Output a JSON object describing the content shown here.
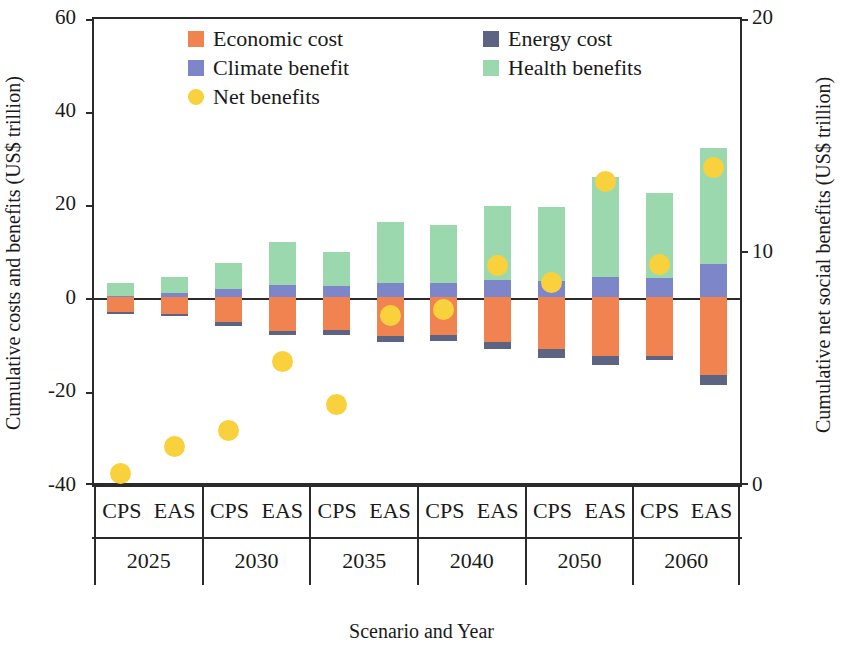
{
  "chart_data": {
    "type": "bar",
    "title": "",
    "xlabel": "Scenario and Year",
    "ylabel": "Cumulative costs and benefits (US$ trillion)",
    "ylabel_right": "Cumulative  net social benefits (US$ trillion)",
    "ylim": [
      -40,
      60
    ],
    "yticks": [
      "60",
      "40",
      "20",
      "0",
      "-20",
      "-40"
    ],
    "ylim_right": [
      0,
      20
    ],
    "yticks_right": [
      "20",
      "10",
      "0"
    ],
    "grid": false,
    "legend_position": "top-center",
    "stacked": true,
    "years": [
      "2025",
      "2030",
      "2035",
      "2040",
      "2050",
      "2060"
    ],
    "scenarios": [
      "CPS",
      "EAS"
    ],
    "categories": [
      "2025 CPS",
      "2025 EAS",
      "2030 CPS",
      "2030 EAS",
      "2035 CPS",
      "2035 EAS",
      "2040 CPS",
      "2040 EAS",
      "2050 CPS",
      "2050 EAS",
      "2060 CPS",
      "2060 EAS"
    ],
    "series": [
      {
        "name": "Economic cost",
        "color": "#F0834F",
        "values": [
          -3.2,
          -3.6,
          -5.4,
          -7.2,
          -7.0,
          -8.4,
          -8.0,
          -9.6,
          -11.2,
          -12.6,
          -12.6,
          -16.8
        ]
      },
      {
        "name": "Energy cost",
        "color": "#5D6383",
        "values": [
          -0.4,
          -0.5,
          -0.8,
          -1.0,
          -1.0,
          -1.2,
          -1.4,
          -1.6,
          -1.8,
          -2.0,
          -1.0,
          -2.0
        ]
      },
      {
        "name": "Climate benefit",
        "color": "#7D86C9",
        "values": [
          0.4,
          0.9,
          1.8,
          2.6,
          2.4,
          3.2,
          3.0,
          3.8,
          3.6,
          4.4,
          4.2,
          7.2
        ]
      },
      {
        "name": "Health benefits",
        "color": "#9CD8AE",
        "values": [
          2.6,
          3.5,
          5.6,
          9.4,
          7.4,
          13.0,
          12.6,
          15.8,
          15.8,
          21.6,
          18.4,
          25.0
        ]
      }
    ],
    "net_benefits": {
      "name": "Net benefits",
      "color": "#F9D13C",
      "axis": "right",
      "unit": "US$ trillion",
      "values_left_axis": [
        -38.0,
        -32.2,
        -28.6,
        -13.8,
        -23.0,
        -3.8,
        -2.6,
        6.8,
        3.2,
        25.0,
        7.0,
        28.0
      ],
      "values": [
        0.4,
        1.6,
        2.4,
        5.6,
        3.6,
        7.7,
        8.0,
        9.8,
        9.3,
        14.0,
        10.0,
        14.6
      ]
    }
  },
  "legend": {
    "items": [
      {
        "label": "Economic cost",
        "color": "#F0834F",
        "shape": "square"
      },
      {
        "label": "Energy cost",
        "color": "#5D6383",
        "shape": "square"
      },
      {
        "label": "Climate benefit",
        "color": "#7D86C9",
        "shape": "square"
      },
      {
        "label": "Health benefits",
        "color": "#9CD8AE",
        "shape": "square"
      },
      {
        "label": "Net benefits",
        "color": "#F9D13C",
        "shape": "circle"
      }
    ]
  },
  "axes": {
    "left_title": "Cumulative costs and benefits (US$ trillion)",
    "right_title": "Cumulative  net social benefits (US$ trillion)",
    "bottom_title": "Scenario and Year",
    "left_ticks": [
      "60",
      "40",
      "20",
      "0",
      "-20",
      "-40"
    ],
    "right_ticks": [
      "20",
      "10",
      "0"
    ]
  },
  "xaxis": {
    "groups": [
      {
        "year": "2025",
        "left": "CPS",
        "right": "EAS"
      },
      {
        "year": "2030",
        "left": "CPS",
        "right": "EAS"
      },
      {
        "year": "2035",
        "left": "CPS",
        "right": "EAS"
      },
      {
        "year": "2040",
        "left": "CPS",
        "right": "EAS"
      },
      {
        "year": "2050",
        "left": "CPS",
        "right": "EAS"
      },
      {
        "year": "2060",
        "left": "CPS",
        "right": "EAS"
      }
    ]
  }
}
